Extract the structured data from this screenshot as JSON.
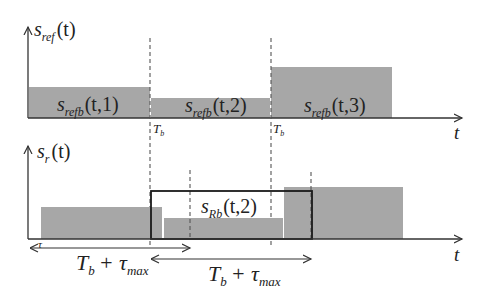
{
  "colors": {
    "bar_fill": "#a7a7a7",
    "axis": "#333333",
    "box": "#1a1a1a",
    "dash": "#555555",
    "background": "#ffffff"
  },
  "top_panel": {
    "y_label": {
      "main": "s",
      "sub": "ref",
      "arg": "(t)"
    },
    "x_label": "t",
    "blocks": [
      {
        "main": "s",
        "sub": "refb",
        "arg": "(t,1)"
      },
      {
        "main": "s",
        "sub": "refb",
        "arg": "(t,2)"
      },
      {
        "main": "s",
        "sub": "refb",
        "arg": "(t,3)"
      }
    ],
    "markers": [
      {
        "main": "T",
        "sub": "b"
      },
      {
        "main": "T",
        "sub": "b"
      }
    ]
  },
  "bottom_panel": {
    "y_label": {
      "main": "s",
      "sub": "r",
      "arg": "(t)"
    },
    "x_label": "t",
    "delay_label": "τ",
    "window": {
      "main": "s",
      "sub": "Rb",
      "arg": "(t,2)"
    },
    "spans": [
      {
        "main": "T",
        "sub": "b",
        "plus": "+ τ",
        "sub2": "max"
      },
      {
        "main": "T",
        "sub": "b",
        "plus": "+ τ",
        "sub2": "max"
      }
    ]
  }
}
